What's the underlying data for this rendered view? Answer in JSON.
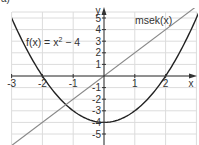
{
  "subpart_label": "a)",
  "chart_data": {
    "type": "line",
    "title": "",
    "xlabel": "x",
    "ylabel": "y",
    "xlim": [
      -3,
      3
    ],
    "ylim": [
      -5.6,
      5.6
    ],
    "grid": true,
    "x_ticks": [
      -3,
      -2,
      -1,
      1,
      2
    ],
    "y_ticks": [
      5,
      4,
      3,
      2,
      1,
      -1,
      -2,
      -3,
      -4,
      -5
    ],
    "series": [
      {
        "name": "f(x) = x² − 4",
        "label": "f(x) = x",
        "label_sup": "2",
        "label_tail": " − 4",
        "formula": "x^2-4",
        "color": "#222222",
        "x": [
          -3,
          -2.5,
          -2,
          -1.5,
          -1,
          -0.5,
          0,
          0.5,
          1,
          1.5,
          2,
          2.5,
          2.9
        ],
        "y": [
          5,
          2.25,
          0,
          -1.75,
          -3,
          -3.75,
          -4,
          -3.75,
          -3,
          -1.75,
          0,
          2.25,
          4.41
        ]
      },
      {
        "name": "msek(x)",
        "label": "msek(x)",
        "formula": "2x",
        "color": "#888888",
        "x": [
          -3,
          3
        ],
        "y": [
          -6,
          6
        ]
      }
    ]
  }
}
